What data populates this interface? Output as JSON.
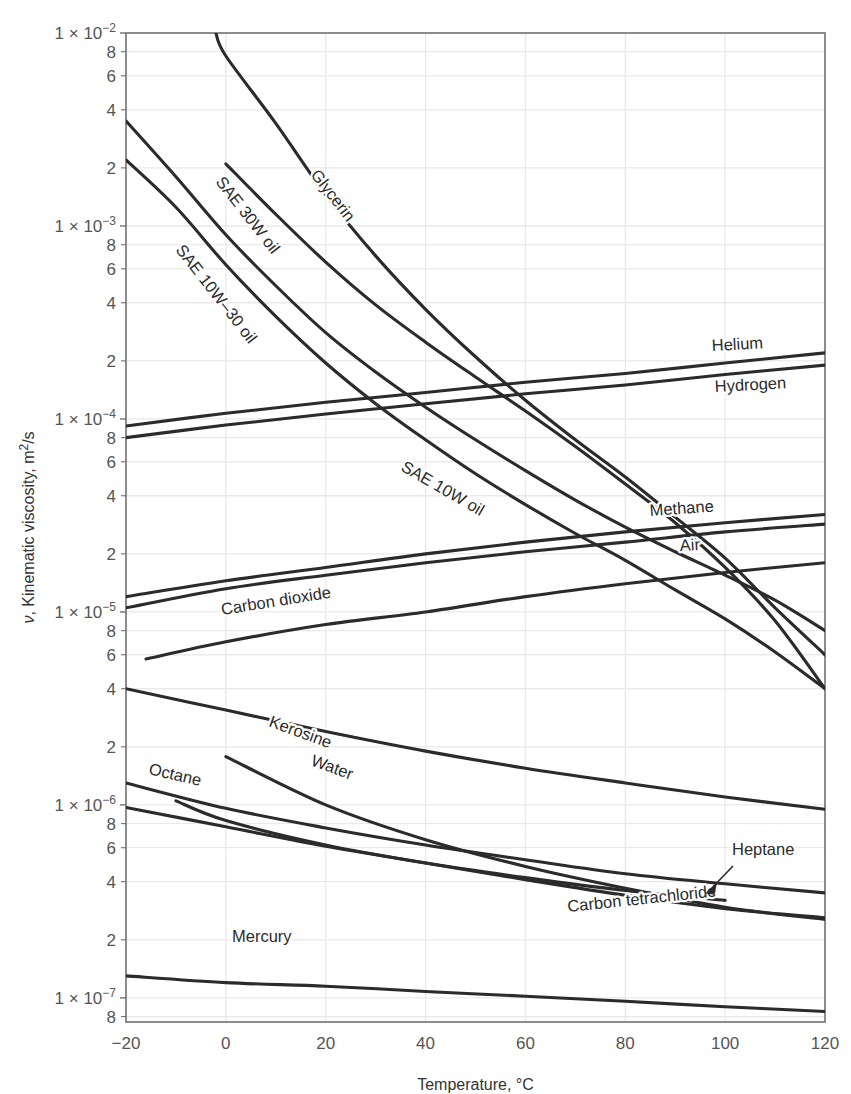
{
  "chart_data": {
    "type": "line",
    "title": "",
    "xlabel": "Temperature, °C",
    "ylabel": "ν, Kinematic viscosity, m²/s",
    "yscale": "log",
    "xlim": [
      -20,
      120
    ],
    "ylim": [
      7.5e-08,
      0.01
    ],
    "grid": true,
    "legend": "inline-curve-labels",
    "xticks": [
      "-20",
      "0",
      "20",
      "40",
      "60",
      "80",
      "100",
      "120"
    ],
    "xtick_values": [
      -20,
      0,
      20,
      40,
      60,
      80,
      100,
      120
    ],
    "ymajor_ticks": [
      {
        "label": "1 × 10",
        "exp": "-2",
        "value": 0.01
      },
      {
        "label": "1 × 10",
        "exp": "-3",
        "value": 0.001
      },
      {
        "label": "1 × 10",
        "exp": "-4",
        "value": 0.0001
      },
      {
        "label": "1 × 10",
        "exp": "-5",
        "value": 1e-05
      },
      {
        "label": "1 × 10",
        "exp": "-6",
        "value": 1e-06
      },
      {
        "label": "1 × 10",
        "exp": "-7",
        "value": 1e-07
      }
    ],
    "yminor_tick_labels": [
      "8",
      "6",
      "4",
      "2"
    ],
    "series": [
      {
        "name": "Glycerin",
        "label": "Glycerin",
        "points": [
          [
            -2,
            0.01
          ],
          [
            0,
            0.0076
          ],
          [
            10,
            0.0034
          ],
          [
            20,
            0.00145
          ],
          [
            30,
            0.0007
          ],
          [
            40,
            0.00037
          ],
          [
            50,
            0.00021
          ],
          [
            60,
            0.000125
          ],
          [
            70,
            7.8e-05
          ],
          [
            80,
            5e-05
          ],
          [
            90,
            3.1e-05
          ],
          [
            100,
            1.9e-05
          ],
          [
            110,
            1.05e-05
          ],
          [
            120,
            6e-06
          ]
        ]
      },
      {
        "name": "SAE 30W oil",
        "label": "SAE 30W oil",
        "points": [
          [
            0,
            0.0021
          ],
          [
            10,
            0.00115
          ],
          [
            20,
            0.00065
          ],
          [
            30,
            0.00039
          ],
          [
            40,
            0.00025
          ],
          [
            50,
            0.000165
          ],
          [
            60,
            0.00011
          ],
          [
            70,
            7.2e-05
          ],
          [
            80,
            4.6e-05
          ],
          [
            90,
            2.9e-05
          ],
          [
            100,
            1.7e-05
          ],
          [
            110,
            9e-06
          ],
          [
            120,
            4e-06
          ]
        ]
      },
      {
        "name": "SAE 10W-30 oil",
        "label": "SAE 10W–30 oil",
        "points": [
          [
            -20,
            0.0035
          ],
          [
            -10,
            0.0018
          ],
          [
            0,
            0.0009
          ],
          [
            10,
            0.00049
          ],
          [
            20,
            0.00028
          ],
          [
            30,
            0.000175
          ],
          [
            40,
            0.000115
          ],
          [
            50,
            7.8e-05
          ],
          [
            60,
            5.4e-05
          ],
          [
            70,
            3.8e-05
          ],
          [
            80,
            2.75e-05
          ],
          [
            90,
            2.05e-05
          ],
          [
            100,
            1.55e-05
          ],
          [
            110,
            1.15e-05
          ],
          [
            120,
            8e-06
          ]
        ]
      },
      {
        "name": "SAE 10W oil",
        "label": "SAE 10W oil",
        "points": [
          [
            -20,
            0.0022
          ],
          [
            -10,
            0.00125
          ],
          [
            0,
            0.00063
          ],
          [
            10,
            0.00034
          ],
          [
            20,
            0.000195
          ],
          [
            30,
            0.00012
          ],
          [
            40,
            7.8e-05
          ],
          [
            50,
            5.2e-05
          ],
          [
            60,
            3.6e-05
          ],
          [
            70,
            2.55e-05
          ],
          [
            80,
            1.85e-05
          ],
          [
            90,
            1.3e-05
          ],
          [
            100,
            9.2e-06
          ],
          [
            110,
            6.2e-06
          ],
          [
            120,
            4e-06
          ]
        ]
      },
      {
        "name": "Helium",
        "label": "Helium",
        "points": [
          [
            -20,
            9.2e-05
          ],
          [
            0,
            0.000107
          ],
          [
            20,
            0.000122
          ],
          [
            40,
            0.000137
          ],
          [
            60,
            0.000155
          ],
          [
            80,
            0.000172
          ],
          [
            100,
            0.000195
          ],
          [
            120,
            0.00022
          ]
        ]
      },
      {
        "name": "Hydrogen",
        "label": "Hydrogen",
        "points": [
          [
            -20,
            8e-05
          ],
          [
            0,
            9.3e-05
          ],
          [
            20,
            0.000106
          ],
          [
            40,
            0.00012
          ],
          [
            60,
            0.000135
          ],
          [
            80,
            0.00015
          ],
          [
            100,
            0.00017
          ],
          [
            120,
            0.00019
          ]
        ]
      },
      {
        "name": "Methane",
        "label": "Methane",
        "points": [
          [
            -20,
            1.2e-05
          ],
          [
            0,
            1.45e-05
          ],
          [
            20,
            1.7e-05
          ],
          [
            40,
            2e-05
          ],
          [
            60,
            2.3e-05
          ],
          [
            80,
            2.6e-05
          ],
          [
            100,
            2.9e-05
          ],
          [
            120,
            3.2e-05
          ]
        ]
      },
      {
        "name": "Air",
        "label": "Air",
        "points": [
          [
            -20,
            1.05e-05
          ],
          [
            0,
            1.32e-05
          ],
          [
            20,
            1.55e-05
          ],
          [
            40,
            1.8e-05
          ],
          [
            60,
            2.05e-05
          ],
          [
            80,
            2.3e-05
          ],
          [
            100,
            2.6e-05
          ],
          [
            120,
            2.85e-05
          ]
        ]
      },
      {
        "name": "Carbon dioxide",
        "label": "Carbon dioxide",
        "points": [
          [
            -16,
            5.7e-06
          ],
          [
            0,
            7e-06
          ],
          [
            20,
            8.6e-06
          ],
          [
            40,
            1e-05
          ],
          [
            60,
            1.2e-05
          ],
          [
            80,
            1.4e-05
          ],
          [
            100,
            1.6e-05
          ],
          [
            120,
            1.8e-05
          ]
        ]
      },
      {
        "name": "Kerosine",
        "label": "Kerosine",
        "points": [
          [
            -20,
            4e-06
          ],
          [
            0,
            3.1e-06
          ],
          [
            20,
            2.4e-06
          ],
          [
            40,
            1.9e-06
          ],
          [
            60,
            1.55e-06
          ],
          [
            80,
            1.3e-06
          ],
          [
            100,
            1.1e-06
          ],
          [
            120,
            9.5e-07
          ]
        ]
      },
      {
        "name": "Water",
        "label": "Water",
        "points": [
          [
            0,
            1.78e-06
          ],
          [
            20,
            1e-06
          ],
          [
            40,
            6.6e-07
          ],
          [
            60,
            4.8e-07
          ],
          [
            80,
            3.7e-07
          ],
          [
            100,
            2.95e-07
          ],
          [
            120,
            2.55e-07
          ]
        ]
      },
      {
        "name": "Octane",
        "label": "Octane",
        "points": [
          [
            -20,
            1.3e-06
          ],
          [
            0,
            9.6e-07
          ],
          [
            20,
            7.6e-07
          ],
          [
            40,
            6.2e-07
          ],
          [
            60,
            5.2e-07
          ],
          [
            80,
            4.4e-07
          ],
          [
            100,
            3.9e-07
          ],
          [
            120,
            3.5e-07
          ]
        ]
      },
      {
        "name": "Heptane",
        "label": "Heptane",
        "points": [
          [
            -10,
            1.05e-06
          ],
          [
            0,
            8.3e-07
          ],
          [
            20,
            6.2e-07
          ],
          [
            40,
            5e-07
          ],
          [
            60,
            4.2e-07
          ],
          [
            80,
            3.6e-07
          ],
          [
            100,
            3.2e-07
          ]
        ]
      },
      {
        "name": "Carbon tetrachloride",
        "label": "Carbon tetrachloride",
        "points": [
          [
            -20,
            9.7e-07
          ],
          [
            0,
            7.7e-07
          ],
          [
            20,
            6.1e-07
          ],
          [
            40,
            5e-07
          ],
          [
            60,
            4.1e-07
          ],
          [
            80,
            3.4e-07
          ],
          [
            100,
            2.9e-07
          ],
          [
            120,
            2.6e-07
          ]
        ]
      },
      {
        "name": "Mercury",
        "label": "Mercury",
        "points": [
          [
            -20,
            1.3e-07
          ],
          [
            0,
            1.2e-07
          ],
          [
            20,
            1.15e-07
          ],
          [
            40,
            1.08e-07
          ],
          [
            60,
            1.02e-07
          ],
          [
            80,
            9.6e-08
          ],
          [
            100,
            9e-08
          ],
          [
            120,
            8.5e-08
          ]
        ]
      }
    ],
    "annotations": [
      {
        "name": "heptane-leader",
        "text": "Heptane",
        "type": "arrow"
      }
    ]
  },
  "colors": {
    "curve": "#2b2b2b",
    "grid": "#e9e9e9",
    "axis": "#707070",
    "text": "#555555",
    "background": "#ffffff"
  }
}
